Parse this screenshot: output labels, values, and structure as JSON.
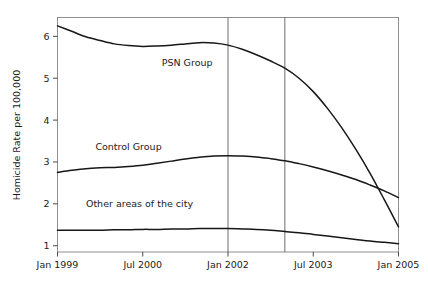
{
  "chart_data": {
    "type": "line",
    "title": "",
    "xlabel": "",
    "ylabel": "Homicide Rate per 100,000",
    "xtick_labels": [
      "Jan 1999",
      "Jul 2000",
      "Jan 2002",
      "Jul 2003",
      "Jan 2005"
    ],
    "ytick_labels": [
      "1",
      "2",
      "3",
      "4",
      "5",
      "6"
    ],
    "ylim": [
      0.85,
      6.45
    ],
    "xlim": [
      0,
      72
    ],
    "grid": false,
    "legend": "inline-annotations",
    "xtick_months": [
      0,
      18,
      36,
      54,
      72
    ],
    "ytick_values": [
      1,
      2,
      3,
      4,
      5,
      6
    ],
    "annotations": [
      {
        "label": "PSN Group",
        "x_month": 22,
        "y_value": 5.28
      },
      {
        "label": "Control Group",
        "x_month": 8,
        "y_value": 3.28
      },
      {
        "label": "Other areas of the city",
        "x_month": 6,
        "y_value": 1.92
      }
    ],
    "reference_lines": [
      {
        "x_month": 36,
        "label": "Jan 2002"
      },
      {
        "x_month": 48,
        "label": "Jan 2003"
      }
    ],
    "series": [
      {
        "name": "PSN Group",
        "color": "#171717",
        "x": [
          0,
          3,
          6,
          9,
          12,
          15,
          18,
          21,
          24,
          27,
          30,
          33,
          36,
          39,
          42,
          45,
          48,
          51,
          54,
          57,
          60,
          63,
          66,
          69,
          72
        ],
        "values": [
          6.25,
          6.12,
          5.99,
          5.9,
          5.82,
          5.78,
          5.76,
          5.77,
          5.79,
          5.82,
          5.85,
          5.84,
          5.79,
          5.69,
          5.56,
          5.41,
          5.24,
          5.0,
          4.68,
          4.28,
          3.82,
          3.3,
          2.73,
          2.1,
          1.45
        ]
      },
      {
        "name": "Control Group",
        "color": "#171717",
        "x": [
          0,
          3,
          6,
          9,
          12,
          15,
          18,
          21,
          24,
          27,
          30,
          33,
          36,
          39,
          42,
          45,
          48,
          51,
          54,
          57,
          60,
          63,
          66,
          69,
          72
        ],
        "values": [
          2.75,
          2.8,
          2.84,
          2.86,
          2.87,
          2.89,
          2.92,
          2.97,
          3.02,
          3.07,
          3.11,
          3.14,
          3.15,
          3.14,
          3.12,
          3.08,
          3.03,
          2.96,
          2.88,
          2.79,
          2.69,
          2.58,
          2.45,
          2.31,
          2.15
        ]
      },
      {
        "name": "Other areas of the city",
        "color": "#171717",
        "x": [
          0,
          3,
          6,
          9,
          12,
          15,
          18,
          21,
          24,
          27,
          30,
          33,
          36,
          39,
          42,
          45,
          48,
          51,
          54,
          57,
          60,
          63,
          66,
          69,
          72
        ],
        "values": [
          1.37,
          1.37,
          1.37,
          1.37,
          1.38,
          1.38,
          1.39,
          1.39,
          1.4,
          1.4,
          1.41,
          1.41,
          1.41,
          1.4,
          1.39,
          1.37,
          1.34,
          1.31,
          1.27,
          1.23,
          1.19,
          1.15,
          1.11,
          1.08,
          1.05
        ]
      }
    ]
  }
}
